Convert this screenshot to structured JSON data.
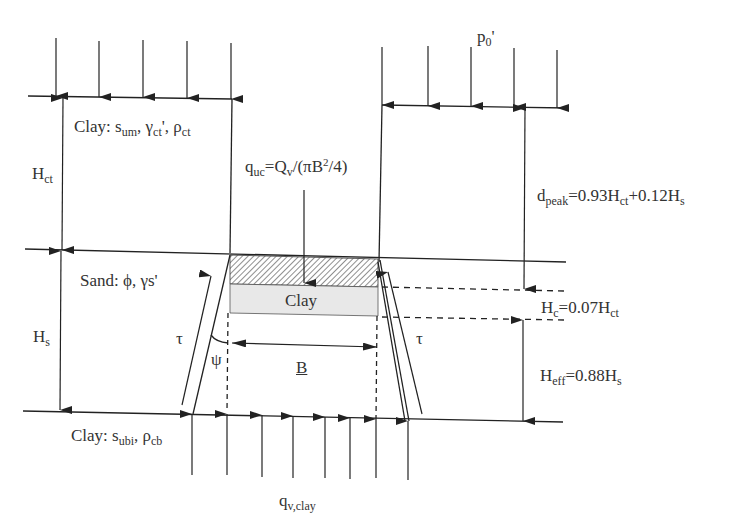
{
  "diagram": {
    "type": "geotechnical cross-section: uplift resistance of pipe/anchor in layered clay-sand-clay soil",
    "layers": [
      {
        "name": "top-clay",
        "label": "Clay",
        "params": [
          "s_um",
          "γ_ct'",
          "ρ_ct"
        ],
        "thickness_label": "H_ct"
      },
      {
        "name": "sand",
        "label": "Sand",
        "params": [
          "φ",
          "γs'"
        ],
        "thickness_label": "H_s"
      },
      {
        "name": "bottom-clay",
        "label": "Clay",
        "params": [
          "s_ubi",
          "ρ_cb"
        ]
      }
    ],
    "labels": {
      "top_clay_prefix": "Clay: ",
      "top_clay_s": "s",
      "top_clay_s_sub": "um",
      "top_clay_gamma": "γ",
      "top_clay_gamma_sub": "ct",
      "top_clay_rho": "ρ",
      "top_clay_rho_sub": "ct",
      "h_ct": "H",
      "h_ct_sub": "ct",
      "sand": "Sand: ϕ, γs'",
      "h_s": "H",
      "h_s_sub": "s",
      "bottom_clay_prefix": "Clay: ",
      "bottom_clay_s": "s",
      "bottom_clay_s_sub": "ubi",
      "bottom_clay_rho": "ρ",
      "bottom_clay_rho_sub": "cb",
      "p0": "p",
      "p0_sub": "0",
      "p0_prime": "'",
      "quc": "q",
      "quc_sub": "uc",
      "quc_eq": "=Q",
      "quc_v": "v",
      "quc_rest": "/(πB",
      "quc_sup": "2",
      "quc_end": "/4)",
      "dpeak": "d",
      "dpeak_sub": "peak",
      "dpeak_eq": "=0.93H",
      "dpeak_ct": "ct",
      "dpeak_rest": "+0.12H",
      "dpeak_s": "s",
      "hc": "H",
      "hc_sub": "c",
      "hc_eq": "=0.07H",
      "hc_ct": "ct",
      "heff": "H",
      "heff_sub": "eff",
      "heff_eq": "=0.88H",
      "heff_s": "s",
      "clay_block": "Clay",
      "tau": "τ",
      "psi": "ψ",
      "b": "B",
      "qv": "q",
      "qv_sub": "v,clay"
    },
    "formulas": {
      "q_uc": "q_uc = Q_v/(πB²/4)",
      "d_peak": "d_peak = 0.93H_ct + 0.12H_s",
      "H_c": "H_c = 0.07H_ct",
      "H_eff": "H_eff = 0.88H_s"
    },
    "colors": {
      "line": "#222222",
      "clay_fill": "#e6e6e6",
      "hatch": "#555555"
    }
  }
}
